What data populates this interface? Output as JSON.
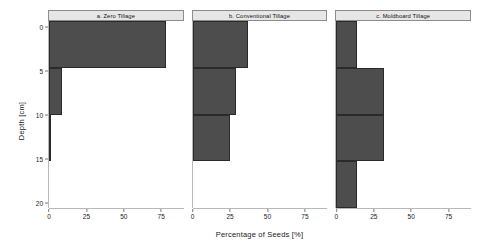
{
  "chart_data": {
    "type": "bar",
    "orientation": "horizontal",
    "title": "",
    "xlabel": "Percentage of Seeds [%]",
    "ylabel": "Depth [cm]",
    "xlim": [
      0,
      90
    ],
    "ylim": [
      0,
      20
    ],
    "y_inverted": true,
    "grid": false,
    "legend": "none",
    "xticks": [
      0,
      25,
      50,
      75
    ],
    "xtick_labels": [
      "0",
      "25",
      "50",
      "75"
    ],
    "yticks": [
      0,
      5,
      10,
      15,
      20
    ],
    "ytick_labels": [
      "0",
      "5",
      "10",
      "15",
      "20"
    ],
    "bar_color": "#4d4d4d",
    "bar_edge_color": "#2a2a2a",
    "strip_color": "#e6e6e6",
    "depth_bins": [
      "0-5",
      "5-10",
      "10-15",
      "15-20"
    ],
    "panels": [
      {
        "id": "a",
        "title": "a. Zero Tillage",
        "values": [
          78,
          9,
          1,
          0
        ]
      },
      {
        "id": "b",
        "title": "b. Conventional Tillage",
        "values": [
          37,
          29,
          25,
          0
        ]
      },
      {
        "id": "c",
        "title": "c. Moldboard Tillage",
        "values": [
          14,
          32,
          32,
          14
        ]
      }
    ]
  }
}
